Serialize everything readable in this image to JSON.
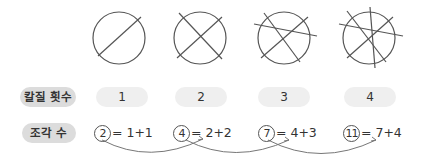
{
  "rows": {
    "cuts_label": "칼질 횟수",
    "pieces_label": "조각 수"
  },
  "cuts": [
    "1",
    "2",
    "3",
    "4"
  ],
  "pieces": [
    {
      "count": "2",
      "expr": "= 1+1"
    },
    {
      "count": "4",
      "expr": "= 2+2"
    },
    {
      "count": "7",
      "expr": "= 4+3"
    },
    {
      "count": "11",
      "expr": "= 7+4"
    }
  ],
  "colors": {
    "line": "#555555",
    "pill": "#efefef",
    "label_pill": "#dcdcdc",
    "arrow": "#777777"
  }
}
